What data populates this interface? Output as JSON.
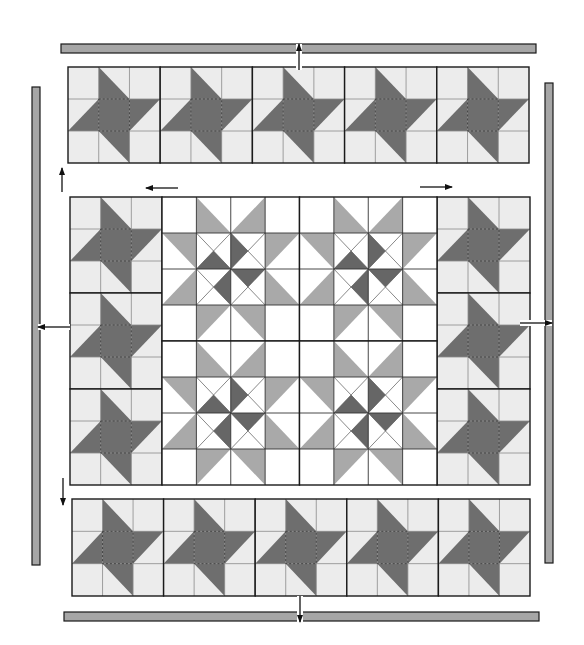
{
  "diagram": {
    "colors": {
      "background": "#ffffff",
      "light_cell": "#ececec",
      "white_cell": "#ffffff",
      "dark": "#6e6e6e",
      "medium": "#a9a9a9",
      "pinwheel_dark": "#666666",
      "border_fill": "#a6a6a6",
      "line": "#1a1a1a",
      "grid": "#8a8a8a"
    },
    "borders": [
      {
        "name": "top-border-strip",
        "x": 61,
        "y": 44,
        "w": 475,
        "h": 9
      },
      {
        "name": "bottom-border-strip",
        "x": 64,
        "y": 612,
        "w": 475,
        "h": 9
      },
      {
        "name": "left-border-strip",
        "x": 32,
        "y": 87,
        "w": 8,
        "h": 478
      },
      {
        "name": "right-border-strip",
        "x": 545,
        "y": 83,
        "w": 8,
        "h": 480
      }
    ],
    "star_rows": [
      {
        "name": "top-star-row",
        "x": 68,
        "y": 67,
        "w": 461,
        "h": 96,
        "count": 5,
        "dir": "h"
      },
      {
        "name": "bottom-star-row",
        "x": 72,
        "y": 499,
        "w": 458,
        "h": 97,
        "count": 5,
        "dir": "h"
      },
      {
        "name": "left-star-column",
        "x": 70,
        "y": 197,
        "w": 92,
        "h": 288,
        "count": 3,
        "dir": "v"
      },
      {
        "name": "right-star-column",
        "x": 437,
        "y": 197,
        "w": 93,
        "h": 288,
        "count": 3,
        "dir": "v"
      }
    ],
    "center": {
      "name": "center-pinwheel-blocks",
      "x": 162,
      "y": 197,
      "w": 275,
      "h": 288,
      "cols": 2,
      "rows": 2
    },
    "arrows": [
      {
        "name": "arrow-up-top-center",
        "x1": 299,
        "y1": 70,
        "x2": 299,
        "y2": 44
      },
      {
        "name": "arrow-down-bottom-center",
        "x1": 300,
        "y1": 596,
        "x2": 300,
        "y2": 622
      },
      {
        "name": "arrow-left-middle-left",
        "x1": 70,
        "y1": 327,
        "x2": 38,
        "y2": 327
      },
      {
        "name": "arrow-right-middle-right",
        "x1": 520,
        "y1": 323,
        "x2": 552,
        "y2": 323
      },
      {
        "name": "arrow-up-left-upper",
        "x1": 62,
        "y1": 192,
        "x2": 62,
        "y2": 168
      },
      {
        "name": "arrow-down-left-lower",
        "x1": 63,
        "y1": 478,
        "x2": 63,
        "y2": 505
      },
      {
        "name": "arrow-left-upper-center",
        "x1": 178,
        "y1": 188,
        "x2": 146,
        "y2": 188
      },
      {
        "name": "arrow-right-upper-center",
        "x1": 420,
        "y1": 187,
        "x2": 452,
        "y2": 187
      }
    ]
  }
}
